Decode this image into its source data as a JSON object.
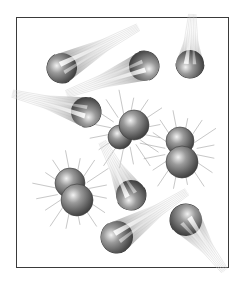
{
  "figure": {
    "frame": {
      "x": 16,
      "y": 17,
      "width": 213,
      "height": 251,
      "border_color": "#3a3a3a"
    },
    "colors": {
      "particle_dark": "#4a4a4a",
      "particle_mid": "#8a8a8a",
      "particle_light": "#e8e8e8",
      "streak": "#b8b8b8"
    },
    "teardrops": [
      {
        "id": "td1",
        "head": [
          62,
          68
        ],
        "r": 15,
        "tail": [
          133,
          30
        ]
      },
      {
        "id": "td2",
        "head": [
          144,
          66
        ],
        "r": 15,
        "tail": [
          72,
          92
        ]
      },
      {
        "id": "td3",
        "head": [
          190,
          64
        ],
        "r": 14,
        "tail": [
          192,
          20
        ]
      },
      {
        "id": "td4",
        "head": [
          86,
          112
        ],
        "r": 15,
        "tail": [
          18,
          95
        ]
      },
      {
        "id": "td5",
        "head": [
          131,
          195
        ],
        "r": 15,
        "tail": [
          105,
          147
        ]
      },
      {
        "id": "td6",
        "head": [
          117,
          237
        ],
        "r": 16,
        "tail": [
          182,
          195
        ]
      },
      {
        "id": "td7",
        "head": [
          186,
          220
        ],
        "r": 16,
        "tail": [
          221,
          266
        ]
      }
    ],
    "molecules": [
      {
        "id": "m1",
        "atoms": [
          {
            "c": [
              120,
              137
            ],
            "r": 12
          },
          {
            "c": [
              134,
              125
            ],
            "r": 15
          }
        ]
      },
      {
        "id": "m2",
        "atoms": [
          {
            "c": [
              180,
              141
            ],
            "r": 14
          },
          {
            "c": [
              182,
              162
            ],
            "r": 16
          }
        ]
      },
      {
        "id": "m3",
        "atoms": [
          {
            "c": [
              70,
              183
            ],
            "r": 15
          },
          {
            "c": [
              77,
              200
            ],
            "r": 16
          }
        ]
      }
    ]
  }
}
